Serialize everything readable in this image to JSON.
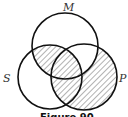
{
  "figure": {
    "caption": "Figure 90",
    "sets": [
      {
        "id": "M",
        "label": "M",
        "cx": 65,
        "cy": 46,
        "r": 33
      },
      {
        "id": "S",
        "label": "S",
        "cx": 50,
        "cy": 77,
        "r": 32
      },
      {
        "id": "P",
        "label": "P",
        "cx": 84,
        "cy": 77,
        "r": 33
      }
    ],
    "shaded_regions": [
      "M∩S (incl. M∩S∩P)",
      "S∩P not M",
      "P only"
    ],
    "unshaded_regions": [
      "M only",
      "S only",
      "M∩P not S"
    ],
    "colors": {
      "stroke": "#111111",
      "hatch": "#444444",
      "background": "#ffffff"
    }
  }
}
